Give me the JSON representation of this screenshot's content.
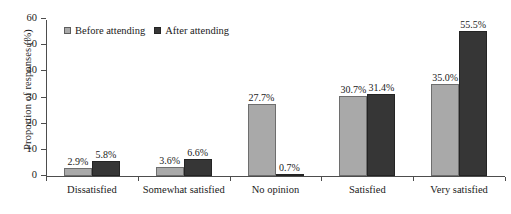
{
  "chart_data": {
    "type": "bar",
    "title": "",
    "xlabel": "",
    "ylabel": "Proportion of responses (%)",
    "ylim": [
      0,
      60
    ],
    "yticks": [
      "0",
      "10",
      "20",
      "30",
      "40",
      "50",
      "60"
    ],
    "grid": false,
    "legend_position": "top-left",
    "categories": [
      "Dissatisfied",
      "Somewhat satisfied",
      "No opinion",
      "Satisfied",
      "Very satisfied"
    ],
    "series": [
      {
        "name": "Before attending",
        "color": "#a9a9a9",
        "values": [
          2.9,
          3.6,
          27.7,
          30.7,
          35.0
        ],
        "labels": [
          "2.9%",
          "3.6%",
          "27.7%",
          "30.7%",
          "35.0%"
        ]
      },
      {
        "name": "After attending",
        "color": "#363636",
        "values": [
          5.8,
          6.6,
          0.7,
          31.4,
          55.5
        ],
        "labels": [
          "5.8%",
          "6.6%",
          "0.7%",
          "31.4%",
          "55.5%"
        ]
      }
    ]
  },
  "legend": {
    "items": [
      {
        "label": "Before attending",
        "swatch": "legend-swatch-before"
      },
      {
        "label": "After attending",
        "swatch": "legend-swatch-after"
      }
    ]
  }
}
